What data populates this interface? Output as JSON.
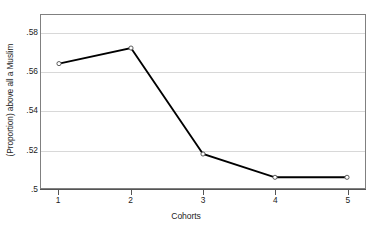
{
  "chart_data": {
    "type": "line",
    "title": "",
    "subtitle": "",
    "xlabel": "Cohorts",
    "ylabel": "(Proportion) above all a Muslim",
    "x": [
      1,
      2,
      3,
      4,
      5
    ],
    "categories": [
      "1",
      "2",
      "3",
      "4",
      "5"
    ],
    "values": [
      0.564,
      0.572,
      0.5175,
      0.5055,
      0.5055
    ],
    "series": [
      {
        "name": "(Proportion) above all a Muslim",
        "values": [
          0.564,
          0.572,
          0.5175,
          0.5055,
          0.5055
        ]
      }
    ],
    "xlim": [
      0.75,
      5.25
    ],
    "ylim": [
      0.5,
      0.589
    ],
    "xticks": [
      1,
      2,
      3,
      4,
      5
    ],
    "xtick_labels": [
      "1",
      "2",
      "3",
      "4",
      "5"
    ],
    "yticks": [
      0.5,
      0.52,
      0.54,
      0.56,
      0.58
    ],
    "ytick_labels": [
      ".5",
      ".52",
      ".54",
      ".56",
      ".58"
    ],
    "grid": "horizontal",
    "legend": "none",
    "marker": "open-circle",
    "line_color": "#000000",
    "grid_color": "#d8d8d8",
    "frame_color": "#808080",
    "background_color": "#ffffff"
  },
  "axes": {
    "y_title": "(Proportion) above all a Muslim",
    "x_title": "Cohorts",
    "y_ticks": [
      {
        "label": ".58",
        "value": 0.58
      },
      {
        "label": ".56",
        "value": 0.56
      },
      {
        "label": ".54",
        "value": 0.54
      },
      {
        "label": ".52",
        "value": 0.52
      },
      {
        "label": ".5",
        "value": 0.5
      }
    ],
    "x_ticks": [
      {
        "label": "1",
        "value": 1
      },
      {
        "label": "2",
        "value": 2
      },
      {
        "label": "3",
        "value": 3
      },
      {
        "label": "4",
        "value": 4
      },
      {
        "label": "5",
        "value": 5
      }
    ]
  }
}
